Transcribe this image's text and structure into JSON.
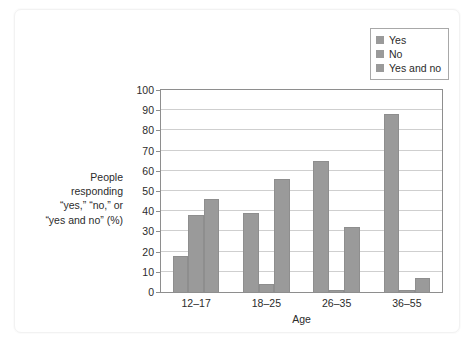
{
  "chart_data": {
    "type": "bar",
    "title": "",
    "subtitle": "",
    "xlabel": "Age",
    "ylabel": "People responding “yes,” “no,” or “yes and no” (%)",
    "categories": [
      "12–17",
      "18–25",
      "26–35",
      "36–55"
    ],
    "series": [
      {
        "name": "Yes",
        "values": [
          18,
          39,
          65,
          88
        ]
      },
      {
        "name": "No",
        "values": [
          38,
          4,
          1,
          1
        ]
      },
      {
        "name": "Yes and no",
        "values": [
          46,
          56,
          32,
          7
        ]
      }
    ],
    "ylim": [
      0,
      100
    ],
    "yticks": [
      0,
      10,
      20,
      30,
      40,
      50,
      60,
      70,
      80,
      90,
      100
    ],
    "ytick_labels": [
      "0",
      "10",
      "20",
      "30",
      "40",
      "50",
      "60",
      "70",
      "80",
      "90",
      "100"
    ],
    "grid": "horizontal",
    "legend_position": "upper-right",
    "bar_color": "#9a9a9a",
    "bar_edge_color": "#8e8e8e",
    "gridline_color": "#cfcfcf",
    "frame_color": "#8e8e8e"
  },
  "y_axis_title_lines": [
    "People responding",
    "“yes,” “no,” or",
    "“yes and no” (%)"
  ],
  "legend": {
    "items": [
      {
        "label": "Yes",
        "color": "#9a9a9a"
      },
      {
        "label": "No",
        "color": "#9a9a9a"
      },
      {
        "label": "Yes and no",
        "color": "#9a9a9a"
      }
    ]
  },
  "x_axis": {
    "title": "Age",
    "tick_labels": [
      "12–17",
      "18–25",
      "26–35",
      "36–55"
    ]
  }
}
